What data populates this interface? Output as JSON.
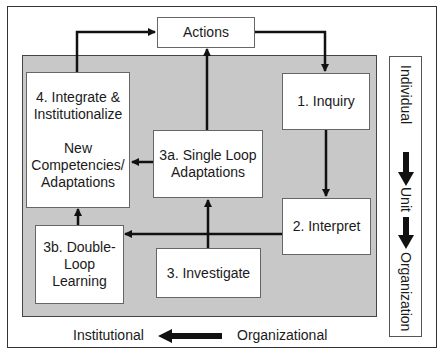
{
  "diagram": {
    "top_partial_title": "",
    "nodes": {
      "actions": {
        "label": "Actions"
      },
      "inquiry": {
        "label": "1. Inquiry"
      },
      "interpret": {
        "label": "2. Interpret"
      },
      "investigate": {
        "label": "3. Investigate"
      },
      "single_loop": {
        "line1": "3a. Single Loop",
        "line2": "Adaptations"
      },
      "double_loop": {
        "line1": "3b. Double-",
        "line2": "Loop",
        "line3": "Learning"
      },
      "integrate": {
        "line1": "4. Integrate &",
        "line2": "Institutionalize",
        "line3": "New",
        "line4": "Competencies/",
        "line5": "Adaptations"
      }
    },
    "edges": [
      {
        "from": "actions",
        "to": "inquiry"
      },
      {
        "from": "inquiry",
        "to": "interpret"
      },
      {
        "from": "interpret",
        "to": "double_loop"
      },
      {
        "from": "investigate",
        "to": "single_loop"
      },
      {
        "from": "single_loop",
        "to": "integrate"
      },
      {
        "from": "single_loop",
        "to": "actions"
      },
      {
        "from": "double_loop",
        "to": "integrate"
      },
      {
        "from": "integrate",
        "to": "actions"
      }
    ],
    "side_scale": {
      "level1": "Individual",
      "level2": "Unit",
      "level3": "Organization",
      "arrow_icon": "down-arrow"
    },
    "bottom_scale": {
      "left": "Institutional",
      "right": "Organizational",
      "arrow_icon": "left-arrow"
    },
    "colors": {
      "background_panel": "#c8c8c8",
      "box_fill": "#ffffff",
      "line": "#111111"
    }
  }
}
